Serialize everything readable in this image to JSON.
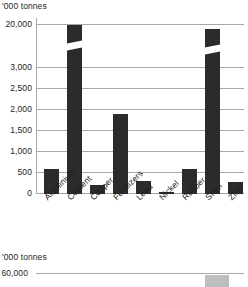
{
  "chart_data": [
    {
      "type": "bar",
      "title": "",
      "unit_label": "'000 tonnes",
      "xlabel": "",
      "ylabel": "'000 tonnes",
      "categories": [
        "Aluminium",
        "Cement",
        "Copper",
        "Fertilizers",
        "Lead",
        "Nickel",
        "Rubber",
        "Steel",
        "Zinc"
      ],
      "values": [
        570,
        20000,
        210,
        2730,
        300,
        20,
        580,
        19000,
        280
      ],
      "ytick_labels": [
        "0",
        "500",
        "1,000",
        "1,500",
        "2,000",
        "2,500",
        "3,000",
        "20,000"
      ],
      "ytick_values": [
        0,
        500,
        1000,
        1500,
        2000,
        2500,
        3000,
        20000
      ],
      "ylim": [
        0,
        20000
      ],
      "broken_axis": true,
      "broken_axis_note": "Scale breaks between 3,000 and 20,000",
      "broken_bars": [
        "Cement",
        "Steel"
      ],
      "grid": true,
      "legend": "none",
      "bar_color": "#2b2b2b",
      "grid_color": "#a7a9ac"
    },
    {
      "type": "bar",
      "title": "",
      "unit_label": "'000 tonnes",
      "ylabel": "'000 tonnes",
      "categories": [
        ""
      ],
      "values": [
        60000
      ],
      "ytick_labels": [
        "60,000"
      ],
      "ytick_values": [
        60000
      ],
      "grid": true,
      "legend": "none",
      "bar_color": "#bcbec0",
      "grid_color": "#a7a9ac",
      "cropped": true
    }
  ],
  "chart1": {
    "unit_label": "'000 tonnes",
    "yticks": [
      {
        "label": "20,000",
        "y": 6
      },
      {
        "label": "3,000",
        "y": 49
      },
      {
        "label": "2,500",
        "y": 70
      },
      {
        "label": "2,000",
        "y": 91
      },
      {
        "label": "1,500",
        "y": 112
      },
      {
        "label": "1,000",
        "y": 133
      },
      {
        "label": "500",
        "y": 154
      },
      {
        "label": "0",
        "y": 175
      }
    ],
    "bars": [
      {
        "name": "Aluminium",
        "x": 8,
        "w": 15,
        "h": 25,
        "broken": false,
        "break_y": 0
      },
      {
        "name": "Cement",
        "x": 31,
        "w": 15,
        "h": 169,
        "broken": true,
        "break_y": 145
      },
      {
        "name": "Copper",
        "x": 54,
        "w": 15,
        "h": 9,
        "broken": false,
        "break_y": 0
      },
      {
        "name": "Fertilizers",
        "x": 77,
        "w": 15,
        "h": 80,
        "broken": false,
        "break_y": 0
      },
      {
        "name": "Lead",
        "x": 100,
        "w": 15,
        "h": 13,
        "broken": false,
        "break_y": 0
      },
      {
        "name": "Nickel",
        "x": 123,
        "w": 15,
        "h": 2,
        "broken": false,
        "break_y": 0
      },
      {
        "name": "Rubber",
        "x": 146,
        "w": 15,
        "h": 25,
        "broken": false,
        "break_y": 0
      },
      {
        "name": "Steel",
        "x": 169,
        "w": 15,
        "h": 165,
        "broken": true,
        "break_y": 141
      },
      {
        "name": "Zinc",
        "x": 192,
        "w": 15,
        "h": 12,
        "broken": false,
        "break_y": 0
      }
    ],
    "xlabels": [
      {
        "label": "Aluminium",
        "x": 6
      },
      {
        "label": "Cement",
        "x": 29
      },
      {
        "label": "Copper",
        "x": 52
      },
      {
        "label": "Fertilizers",
        "x": 75
      },
      {
        "label": "Lead",
        "x": 98
      },
      {
        "label": "Nickel",
        "x": 121
      },
      {
        "label": "Rubber",
        "x": 144
      },
      {
        "label": "Steel",
        "x": 167
      },
      {
        "label": "Zinc",
        "x": 190
      }
    ]
  },
  "chart2": {
    "unit_label": "'000 tonnes",
    "ytick": "60,000",
    "bar": {
      "x": 169,
      "w": 24,
      "h": 12
    }
  }
}
